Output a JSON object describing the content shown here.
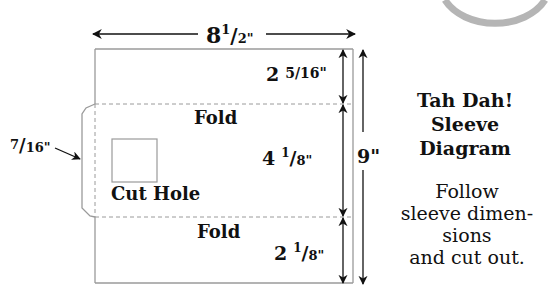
{
  "diagram": {
    "width_label": {
      "whole": "8",
      "num": "1",
      "den": "2\""
    },
    "height_label": "9\"",
    "top_section_label": {
      "whole": "2",
      "frac": "5/16\""
    },
    "middle_section_label": {
      "whole": "4",
      "num": "1",
      "den": "8\""
    },
    "bottom_section_label": {
      "whole": "2",
      "num": "1",
      "den": "8\""
    },
    "flap_label": {
      "num": "7",
      "den": "16\""
    },
    "fold_top_label": "Fold",
    "fold_bottom_label": "Fold",
    "cut_hole_label": "Cut Hole",
    "colors": {
      "outline": "#9a9a9a",
      "arrow": "#111111",
      "text": "#111111",
      "badge_ring": "#b5b5b5"
    }
  },
  "title": {
    "lines": [
      "Tah Dah!",
      "Sleeve",
      "Diagram"
    ]
  },
  "instructions": {
    "lines": [
      "Follow",
      "sleeve dimen-",
      "sions",
      "and cut out."
    ]
  }
}
